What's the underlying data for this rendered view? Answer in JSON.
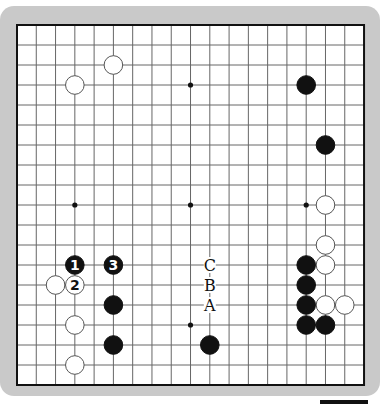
{
  "board": {
    "size": 19,
    "origin_x": 17,
    "origin_y": 25,
    "step_x": 19.28,
    "step_y": 20,
    "frame_color": "#c9c9c9",
    "board_color": "#ffffff",
    "line_color": "#666666",
    "border_color": "#111111",
    "stone_black": "#111111",
    "stone_white": "#ffffff",
    "hoshi": [
      [
        3,
        3
      ],
      [
        9,
        3
      ],
      [
        15,
        3
      ],
      [
        3,
        9
      ],
      [
        9,
        9
      ],
      [
        15,
        9
      ],
      [
        3,
        15
      ],
      [
        9,
        15
      ],
      [
        15,
        15
      ]
    ]
  },
  "stones": [
    {
      "color": "white",
      "col": 3,
      "row": 3,
      "label": ""
    },
    {
      "color": "white",
      "col": 5,
      "row": 2,
      "label": ""
    },
    {
      "color": "black",
      "col": 15,
      "row": 3,
      "label": ""
    },
    {
      "color": "black",
      "col": 16,
      "row": 6,
      "label": ""
    },
    {
      "color": "white",
      "col": 16,
      "row": 9,
      "label": ""
    },
    {
      "color": "white",
      "col": 16,
      "row": 11,
      "label": ""
    },
    {
      "color": "black",
      "col": 15,
      "row": 12,
      "label": ""
    },
    {
      "color": "white",
      "col": 16,
      "row": 12,
      "label": ""
    },
    {
      "color": "black",
      "col": 15,
      "row": 13,
      "label": ""
    },
    {
      "color": "black",
      "col": 15,
      "row": 14,
      "label": ""
    },
    {
      "color": "white",
      "col": 16,
      "row": 14,
      "label": ""
    },
    {
      "color": "white",
      "col": 17,
      "row": 14,
      "label": ""
    },
    {
      "color": "black",
      "col": 15,
      "row": 15,
      "label": ""
    },
    {
      "color": "black",
      "col": 16,
      "row": 15,
      "label": ""
    },
    {
      "color": "black",
      "col": 3,
      "row": 12,
      "label": "1"
    },
    {
      "color": "black",
      "col": 5,
      "row": 12,
      "label": "3"
    },
    {
      "color": "white",
      "col": 2,
      "row": 13,
      "label": ""
    },
    {
      "color": "white",
      "col": 3,
      "row": 13,
      "label": "2"
    },
    {
      "color": "black",
      "col": 5,
      "row": 14,
      "label": ""
    },
    {
      "color": "white",
      "col": 3,
      "row": 15,
      "label": ""
    },
    {
      "color": "black",
      "col": 5,
      "row": 16,
      "label": ""
    },
    {
      "color": "white",
      "col": 3,
      "row": 17,
      "label": ""
    },
    {
      "color": "black",
      "col": 10,
      "row": 16,
      "label": ""
    }
  ],
  "markers": [
    {
      "text": "C",
      "col": 10,
      "row": 12
    },
    {
      "text": "B",
      "col": 10,
      "row": 13
    },
    {
      "text": "A",
      "col": 10,
      "row": 14
    }
  ]
}
